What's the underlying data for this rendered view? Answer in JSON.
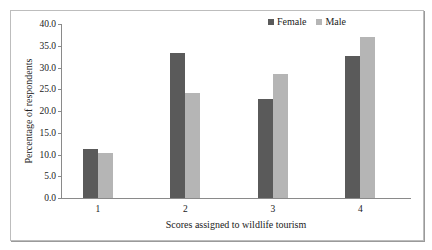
{
  "chart_data": {
    "type": "bar",
    "title": "",
    "xlabel": "Scores assigned to wildlife tourism",
    "ylabel": "Percentage of respondents",
    "categories": [
      "1",
      "2",
      "3",
      "4"
    ],
    "series": [
      {
        "name": "Female",
        "color": "#5a5a5a",
        "values": [
          11.3,
          33.3,
          22.7,
          32.6
        ]
      },
      {
        "name": "Male",
        "color": "#b5b5b5",
        "values": [
          10.3,
          24.1,
          28.4,
          37.0
        ]
      }
    ],
    "ylim": [
      0,
      40
    ],
    "yticks": [
      "0.0",
      "5.0",
      "10.0",
      "15.0",
      "20.0",
      "25.0",
      "30.0",
      "35.0",
      "40.0"
    ],
    "grid": false,
    "legend_position": "top-right"
  }
}
